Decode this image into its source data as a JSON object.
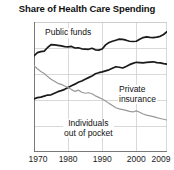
{
  "chart_data": {
    "type": "line",
    "title": "Share of Health Care Spending",
    "xlabel": "",
    "ylabel": "",
    "xlim": [
      1970,
      2009
    ],
    "ylim": [
      0,
      50
    ],
    "grid": true,
    "legend_position": "inline-annotations",
    "y_ticks": [
      "50%",
      "40",
      "30",
      "20",
      "10",
      "0"
    ],
    "y_tick_values": [
      50,
      40,
      30,
      20,
      10,
      0
    ],
    "x_ticks": [
      "1970",
      "1980",
      "1990",
      "2000",
      "2009"
    ],
    "x_tick_values": [
      1970,
      1980,
      1990,
      2000,
      2009
    ],
    "x": [
      1970,
      1971,
      1972,
      1973,
      1974,
      1975,
      1976,
      1977,
      1978,
      1979,
      1980,
      1981,
      1982,
      1983,
      1984,
      1985,
      1986,
      1987,
      1988,
      1989,
      1990,
      1991,
      1992,
      1993,
      1994,
      1995,
      1996,
      1997,
      1998,
      1999,
      2000,
      2001,
      2002,
      2003,
      2004,
      2005,
      2006,
      2007,
      2008,
      2009
    ],
    "series": [
      {
        "name": "Public funds",
        "color": "#1a1a1a",
        "label": "Public funds",
        "values": [
          37.0,
          38.2,
          38.6,
          38.8,
          40.2,
          41.3,
          41.2,
          41.0,
          40.8,
          40.5,
          40.4,
          40.6,
          40.0,
          40.1,
          39.7,
          39.6,
          39.5,
          39.9,
          39.3,
          39.2,
          39.6,
          41.2,
          42.1,
          42.6,
          43.0,
          43.4,
          43.3,
          43.0,
          42.6,
          42.5,
          42.6,
          43.4,
          44.0,
          44.3,
          44.1,
          44.0,
          44.2,
          44.5,
          45.2,
          46.3
        ]
      },
      {
        "name": "Private insurance",
        "color": "#1a1a1a",
        "label": "Private insurance",
        "values": [
          20.4,
          20.9,
          21.1,
          21.5,
          21.9,
          22.0,
          22.6,
          23.2,
          23.6,
          24.1,
          24.8,
          25.5,
          26.1,
          26.8,
          27.3,
          28.0,
          28.6,
          29.2,
          30.1,
          30.5,
          30.8,
          31.2,
          31.6,
          32.2,
          32.8,
          32.6,
          32.3,
          32.9,
          33.6,
          34.1,
          34.5,
          34.4,
          34.3,
          34.5,
          34.6,
          34.7,
          34.4,
          34.3,
          34.0,
          33.8
        ]
      },
      {
        "name": "Individuals out of pocket",
        "color": "#999999",
        "label_line1": "Individuals",
        "label_line2": "out of pocket",
        "values": [
          33.2,
          32.0,
          31.0,
          30.2,
          29.0,
          28.0,
          27.2,
          26.4,
          26.0,
          25.4,
          24.8,
          24.0,
          23.3,
          23.8,
          23.0,
          22.6,
          22.8,
          22.4,
          21.6,
          21.0,
          20.4,
          19.6,
          18.7,
          17.9,
          17.0,
          16.6,
          16.3,
          16.0,
          15.6,
          15.4,
          15.8,
          15.3,
          14.6,
          14.2,
          13.9,
          13.6,
          13.2,
          12.9,
          12.6,
          12.3
        ]
      }
    ]
  }
}
